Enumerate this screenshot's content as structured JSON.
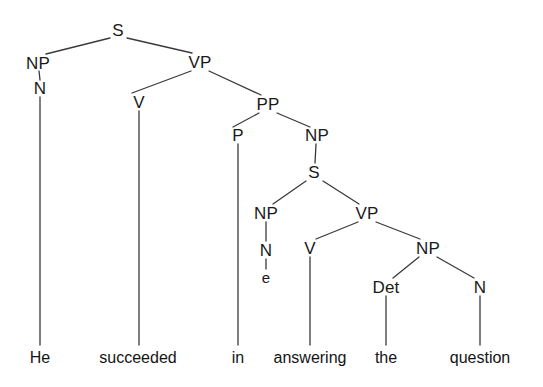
{
  "figure": {
    "kind": "syntax-tree",
    "sentence": "He succeeded in answering the question",
    "line_color": "#3a3a3a",
    "text_color": "#1a1a1a",
    "background": "#ffffff",
    "width": 543,
    "height": 387
  },
  "nodes": [
    {
      "id": "S1",
      "label": "S",
      "x": 118,
      "y": 30
    },
    {
      "id": "NP1",
      "label": "NP",
      "x": 38,
      "y": 63
    },
    {
      "id": "N1",
      "label": "N",
      "x": 40,
      "y": 88
    },
    {
      "id": "VP1",
      "label": "VP",
      "x": 200,
      "y": 62
    },
    {
      "id": "V1",
      "label": "V",
      "x": 139,
      "y": 102
    },
    {
      "id": "PP1",
      "label": "PP",
      "x": 268,
      "y": 104
    },
    {
      "id": "P1",
      "label": "P",
      "x": 238,
      "y": 135
    },
    {
      "id": "NP2",
      "label": "NP",
      "x": 317,
      "y": 135
    },
    {
      "id": "S2",
      "label": "S",
      "x": 314,
      "y": 172
    },
    {
      "id": "NP3",
      "label": "NP",
      "x": 266,
      "y": 213
    },
    {
      "id": "N2",
      "label": "N",
      "x": 266,
      "y": 250
    },
    {
      "id": "VP2",
      "label": "VP",
      "x": 367,
      "y": 213
    },
    {
      "id": "V2",
      "label": "V",
      "x": 310,
      "y": 248
    },
    {
      "id": "NP4",
      "label": "NP",
      "x": 428,
      "y": 248
    },
    {
      "id": "Det1",
      "label": "Det",
      "x": 386,
      "y": 287
    },
    {
      "id": "N3",
      "label": "N",
      "x": 480,
      "y": 287
    }
  ],
  "trace": {
    "id": "e1",
    "label": "e",
    "x": 266,
    "y": 277
  },
  "terminals": [
    {
      "id": "w1",
      "label": "He",
      "x": 40,
      "y": 350
    },
    {
      "id": "w2",
      "label": "succeeded",
      "x": 138,
      "y": 350
    },
    {
      "id": "w3",
      "label": "in",
      "x": 238,
      "y": 350
    },
    {
      "id": "w4",
      "label": "answering",
      "x": 310,
      "y": 350
    },
    {
      "id": "w5",
      "label": "the",
      "x": 386,
      "y": 350
    },
    {
      "id": "w6",
      "label": "question",
      "x": 480,
      "y": 350
    }
  ],
  "edges": [
    {
      "from": "S1",
      "to": "NP1",
      "x1": 110,
      "y1": 38,
      "x2": 46,
      "y2": 54
    },
    {
      "from": "S1",
      "to": "VP1",
      "x1": 127,
      "y1": 38,
      "x2": 192,
      "y2": 53
    },
    {
      "from": "NP1",
      "to": "N1",
      "x1": 39,
      "y1": 71,
      "x2": 40,
      "y2": 80
    },
    {
      "from": "N1",
      "to": "w1",
      "x1": 40,
      "y1": 97,
      "x2": 40,
      "y2": 345
    },
    {
      "from": "VP1",
      "to": "V1",
      "x1": 191,
      "y1": 71,
      "x2": 132,
      "y2": 93
    },
    {
      "from": "VP1",
      "to": "PP1",
      "x1": 209,
      "y1": 71,
      "x2": 261,
      "y2": 95
    },
    {
      "from": "V1",
      "to": "w2",
      "x1": 139,
      "y1": 111,
      "x2": 139,
      "y2": 345
    },
    {
      "from": "PP1",
      "to": "P1",
      "x1": 259,
      "y1": 113,
      "x2": 233,
      "y2": 127
    },
    {
      "from": "PP1",
      "to": "NP2",
      "x1": 277,
      "y1": 113,
      "x2": 310,
      "y2": 127
    },
    {
      "from": "P1",
      "to": "w3",
      "x1": 238,
      "y1": 144,
      "x2": 238,
      "y2": 345
    },
    {
      "from": "NP2",
      "to": "S2",
      "x1": 316,
      "y1": 144,
      "x2": 315,
      "y2": 163
    },
    {
      "from": "S2",
      "to": "NP3",
      "x1": 306,
      "y1": 181,
      "x2": 273,
      "y2": 204
    },
    {
      "from": "S2",
      "to": "VP2",
      "x1": 323,
      "y1": 181,
      "x2": 359,
      "y2": 204
    },
    {
      "from": "NP3",
      "to": "N2",
      "x1": 266,
      "y1": 222,
      "x2": 266,
      "y2": 241
    },
    {
      "from": "N2",
      "to": "e1",
      "x1": 266,
      "y1": 259,
      "x2": 266,
      "y2": 269
    },
    {
      "from": "VP2",
      "to": "V2",
      "x1": 358,
      "y1": 222,
      "x2": 316,
      "y2": 239
    },
    {
      "from": "VP2",
      "to": "NP4",
      "x1": 376,
      "y1": 222,
      "x2": 420,
      "y2": 239
    },
    {
      "from": "V2",
      "to": "w4",
      "x1": 310,
      "y1": 257,
      "x2": 310,
      "y2": 345
    },
    {
      "from": "NP4",
      "to": "Det1",
      "x1": 419,
      "y1": 257,
      "x2": 393,
      "y2": 278
    },
    {
      "from": "NP4",
      "to": "N3",
      "x1": 437,
      "y1": 257,
      "x2": 474,
      "y2": 278
    },
    {
      "from": "Det1",
      "to": "w5",
      "x1": 386,
      "y1": 296,
      "x2": 386,
      "y2": 345
    },
    {
      "from": "N3",
      "to": "w6",
      "x1": 480,
      "y1": 296,
      "x2": 480,
      "y2": 345
    }
  ]
}
